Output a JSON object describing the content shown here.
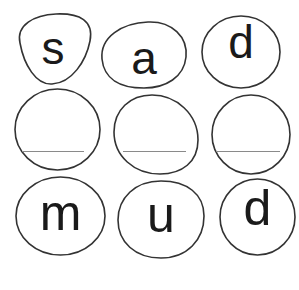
{
  "worksheet": {
    "rows": [
      {
        "cells": [
          {
            "letter": "s"
          },
          {
            "letter": "a"
          },
          {
            "letter": "d"
          }
        ]
      },
      {
        "cells": [
          {
            "letter": ""
          },
          {
            "letter": ""
          },
          {
            "letter": ""
          }
        ]
      },
      {
        "cells": [
          {
            "letter": "m"
          },
          {
            "letter": "u"
          },
          {
            "letter": "d"
          }
        ]
      }
    ]
  },
  "colors": {
    "outline": "#333333",
    "text": "#1a1a1a",
    "line": "#8a8a8a",
    "background": "#ffffff"
  }
}
